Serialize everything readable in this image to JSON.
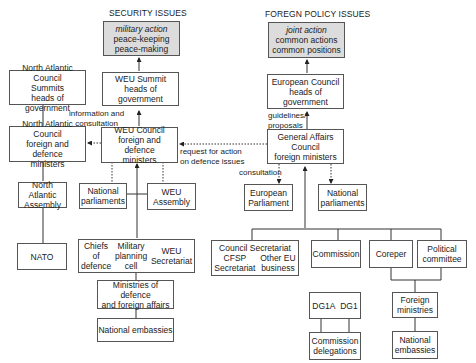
{
  "headers": {
    "security": "SECURITY ISSUES",
    "foreign_policy": "FOREGN POLICY ISSUES"
  },
  "security": {
    "outcome": {
      "title": "military action",
      "lines": [
        "peace-keeping",
        "peace-making"
      ]
    },
    "weu_summit": [
      "WEU Summit",
      "heads of government"
    ],
    "nac_summits": [
      "North Atlantic Council",
      "Summits",
      "heads of government"
    ],
    "nac_ministers": [
      "North Atlantic Council",
      "foreign and defence",
      "ministers"
    ],
    "weu_council": [
      "WEU Council",
      "foreign and defence",
      "ministers"
    ],
    "north_atlantic_assembly": [
      "North Atlantic",
      "Assembly"
    ],
    "national_parliaments": [
      "National",
      "parliaments"
    ],
    "weu_assembly": [
      "WEU",
      "Assembly"
    ],
    "nato": "NATO",
    "weu_bodies": {
      "chiefs": [
        "Chiefs",
        "of",
        "defence"
      ],
      "military": [
        "Military",
        "planning",
        "cell"
      ],
      "secretariat": [
        "WEU",
        "Secretariat"
      ]
    },
    "ministries": [
      "Ministries of defence",
      "and foreign affairs"
    ],
    "embassies": "National embassies"
  },
  "foreign_policy": {
    "outcome": {
      "title": "joint action",
      "lines": [
        "common actions",
        "common positions"
      ]
    },
    "european_council": [
      "European Council",
      "heads of government"
    ],
    "gac": [
      "General Affairs",
      "Council",
      "foreign ministers"
    ],
    "european_parliament": [
      "European",
      "Parliament"
    ],
    "national_parliaments": [
      "National",
      "parliaments"
    ],
    "council_secretariat": {
      "title": "Council Secretariat",
      "left": [
        "CFSP",
        "Secretariat"
      ],
      "right": [
        "Other EU",
        "business"
      ]
    },
    "commission": "Commission",
    "coreper": "Coreper",
    "political_committee": [
      "Political",
      "committee"
    ],
    "dgs": [
      "DG1A",
      "DG1"
    ],
    "commission_delegations": [
      "Commission",
      "delegations"
    ],
    "foreign_ministries": [
      "Foreign",
      "ministries"
    ],
    "national_embassies": [
      "National",
      "embassies"
    ]
  },
  "labels": {
    "info_consultation": [
      "information and",
      "consultation"
    ],
    "request": [
      "request for action",
      "on defence issues"
    ],
    "guidelines": [
      "guidelines/",
      "proposals"
    ],
    "consultation": "consultation"
  }
}
